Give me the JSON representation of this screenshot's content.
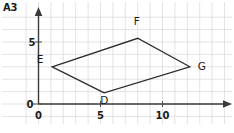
{
  "figure": {
    "label": "A3",
    "background_color": "#ffffff",
    "grid_color": "#dcdcdc",
    "axis_color": "#3a3a3a",
    "shape_color": "#2b2b2b"
  },
  "chart_data": {
    "type": "scatter",
    "title": "A3",
    "xlabel": "",
    "ylabel": "",
    "xlim": [
      -1,
      15
    ],
    "ylim": [
      -1,
      7
    ],
    "grid": true,
    "grid_spacing": 1,
    "legend": "none",
    "x_ticks": [
      {
        "value": 0,
        "label": "0"
      },
      {
        "value": 5,
        "label": "5"
      },
      {
        "value": 10,
        "label": "10"
      }
    ],
    "y_ticks": [
      {
        "value": 0,
        "label": "0"
      },
      {
        "value": 5,
        "label": "5"
      }
    ],
    "origin_label": "0",
    "shape": {
      "name": "parallelogram DEFG",
      "closed": true,
      "vertices": [
        {
          "label": "D",
          "x": 5.3,
          "y": 0.9,
          "label_dx": 0,
          "label_dy": -11
        },
        {
          "label": "E",
          "x": 1.1,
          "y": 3.0,
          "label_dx": -12,
          "label_dy": 4
        },
        {
          "label": "F",
          "x": 8.0,
          "y": 5.3,
          "label_dx": -1,
          "label_dy": 13
        },
        {
          "label": "G",
          "x": 12.2,
          "y": 3.0,
          "label_dx": 12,
          "label_dy": -3
        }
      ]
    }
  }
}
